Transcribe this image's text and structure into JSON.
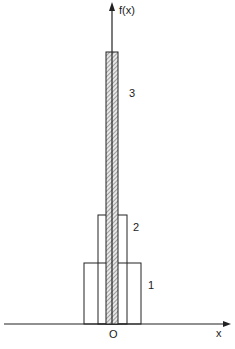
{
  "diagram": {
    "y_axis_label": "f(x)",
    "x_axis_label": "x",
    "origin_label": "O",
    "functions": [
      {
        "label": "1",
        "relative_width": 4,
        "relative_height": 1,
        "hatched": false
      },
      {
        "label": "2",
        "relative_width": 2,
        "relative_height": 2,
        "hatched": false
      },
      {
        "label": "3",
        "relative_width": 1,
        "relative_height": 6.5,
        "hatched": true
      }
    ]
  }
}
